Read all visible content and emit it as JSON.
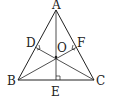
{
  "diagram": {
    "type": "geometry",
    "points": {
      "A": {
        "label": "A",
        "x": 56,
        "y": 10
      },
      "B": {
        "label": "B",
        "x": 18,
        "y": 80
      },
      "C": {
        "label": "C",
        "x": 94,
        "y": 80
      },
      "D": {
        "label": "D",
        "x": 35,
        "y": 47
      },
      "E": {
        "label": "E",
        "x": 56,
        "y": 80
      },
      "F": {
        "label": "F",
        "x": 77,
        "y": 47
      },
      "O": {
        "label": "O",
        "x": 56,
        "y": 57
      }
    },
    "segments": [
      "AB",
      "BC",
      "CA",
      "AE",
      "BF",
      "CD"
    ],
    "right_angles": [
      "D",
      "E",
      "F"
    ],
    "colors": {
      "stroke": "#222222",
      "background": "#ffffff"
    }
  }
}
